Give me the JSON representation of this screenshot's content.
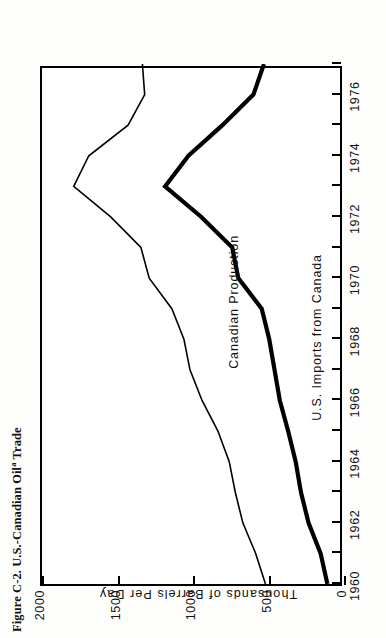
{
  "figure": {
    "title_prefix": "Figure C-2. U.S.-Canadian Oil",
    "title_superscript": "a",
    "title_suffix": " Trade"
  },
  "chart_data": {
    "type": "line",
    "orientation": "rotated-90-ccw",
    "xlabel": "",
    "ylabel": "Thousands of Barrels Per Day",
    "xlim": [
      1960,
      1977
    ],
    "ylim": [
      0,
      2000
    ],
    "grid": false,
    "legend": "inline-labels",
    "xticks": [
      1960,
      1961,
      1962,
      1963,
      1964,
      1965,
      1966,
      1967,
      1968,
      1969,
      1970,
      1971,
      1972,
      1973,
      1974,
      1975,
      1976,
      1977
    ],
    "xticklabels": [
      "1960",
      "",
      "1962",
      "",
      "1964",
      "",
      "1966",
      "",
      "1968",
      "",
      "1970",
      "",
      "1972",
      "",
      "1974",
      "",
      "1976",
      ""
    ],
    "yticks": [
      0,
      500,
      1000,
      1500,
      2000
    ],
    "yticklabels": [
      "0",
      "500",
      "1000",
      "1500",
      "2000"
    ],
    "x": [
      1960,
      1961,
      1962,
      1963,
      1964,
      1965,
      1966,
      1967,
      1968,
      1969,
      1970,
      1971,
      1972,
      1973,
      1974,
      1975,
      1976,
      1977
    ],
    "series": [
      {
        "name": "Canadian Production",
        "style": "thin",
        "values": [
          520,
          585,
          670,
          720,
          760,
          835,
          940,
          1020,
          1060,
          1140,
          1290,
          1345,
          1545,
          1790,
          1690,
          1430,
          1320,
          1335
        ]
      },
      {
        "name": "U.S. Imports from Canada",
        "style": "thick",
        "values": [
          110,
          155,
          235,
          285,
          320,
          370,
          425,
          460,
          495,
          545,
          700,
          740,
          945,
          1185,
          1030,
          805,
          600,
          530
        ]
      }
    ],
    "annotations": [
      {
        "text": "Canadian Production",
        "series": "Canadian Production"
      },
      {
        "text": "U.S. Imports from Canada",
        "series": "U.S. Imports from Canada"
      }
    ]
  }
}
